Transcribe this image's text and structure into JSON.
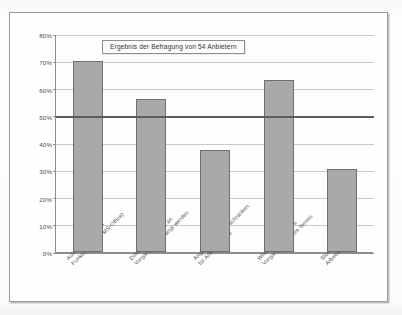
{
  "chart_data": {
    "type": "bar",
    "title": "Ergebnis der Befragung von 54 Anbietern",
    "xlabel": "",
    "ylabel": "",
    "ylim": [
      0,
      80
    ],
    "ytick_step": 10,
    "grid": true,
    "legend": "none",
    "reference_line": {
      "value": 50,
      "label": "50%"
    },
    "categories": [
      "Aufruf von externen Funktionen (z.B. MS-Office)",
      "Dokumente können an Vorgänge angehängt werden",
      "Angabe von Terminschranken für Arbeitsschritte",
      "Wiedervorlage eines Vorgangs zu einem Termin",
      "Stornierung von Arbeitsschritten"
    ],
    "categories_lines": [
      [
        "Aufruf von externen",
        "Funktionen (z.B. MS-Office)"
      ],
      [
        "Dokumente können an",
        "Vorgänge angehängt werden"
      ],
      [
        "Angabe von Terminschranken",
        "für Arbeitsschritte"
      ],
      [
        "Wiedervorlage eines",
        "Vorgangs zu einem Termin"
      ],
      [
        "Stornierung von",
        "Arbeitsschritten"
      ]
    ],
    "values": [
      70,
      56,
      37.5,
      63,
      30.5
    ],
    "ytick_labels": [
      "80%",
      "70%",
      "60%",
      "50%",
      "40%",
      "30%",
      "20%",
      "10%",
      "0%"
    ],
    "ytick_values": [
      80,
      70,
      60,
      50,
      40,
      30,
      20,
      10,
      0
    ],
    "colors": {
      "bar_fill": "#a9a9a9",
      "bar_border": "#6f6f6f",
      "gridline": "#c9c9c9",
      "axis": "#8c8c8c",
      "reference_line": "#5d5d5d",
      "plot_background": "#fefefe",
      "frame_border": "#9a9a9a",
      "text": "#4a4a4a"
    }
  }
}
